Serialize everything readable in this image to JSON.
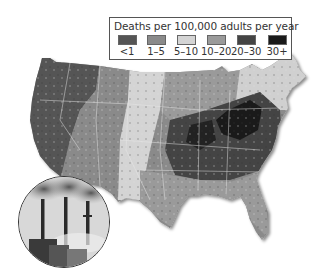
{
  "legend": {
    "title": "Deaths per 100,000 adults per year",
    "items": [
      {
        "label": "<1",
        "color": "#555555"
      },
      {
        "label": "1–5",
        "color": "#8a8a8a"
      },
      {
        "label": "5–10",
        "color": "#d4d4d4"
      },
      {
        "label": "10–20",
        "color": "#9a9a9a"
      },
      {
        "label": "20–30",
        "color": "#444444"
      },
      {
        "label": "30+",
        "color": "#1a1a1a"
      }
    ]
  },
  "map": {
    "subject": "Contiguous United States",
    "regions": [
      {
        "name": "Pacific Northwest & West",
        "category": "<1"
      },
      {
        "name": "Mountain West",
        "category": "1–5"
      },
      {
        "name": "Great Plains",
        "category": "5–10"
      },
      {
        "name": "Upper Midwest",
        "category": "10–20"
      },
      {
        "name": "Ohio Valley & Southeast",
        "category": "20–30"
      },
      {
        "name": "Ohio / West Virginia / Kentucky",
        "category": "30+"
      },
      {
        "name": "Gulf Coast & Florida",
        "category": "10–20"
      },
      {
        "name": "New England",
        "category": "5–10"
      }
    ]
  },
  "inset": {
    "subject": "smokestacks emitting smoke"
  }
}
